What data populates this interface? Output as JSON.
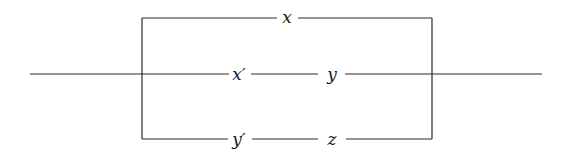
{
  "diagram": {
    "type": "switching-circuit",
    "stroke_color": "#2a2a2a",
    "text_color": "#1a1a1a",
    "background": "#ffffff",
    "branches": [
      {
        "name": "top",
        "switches": [
          "x"
        ]
      },
      {
        "name": "middle",
        "switches": [
          "x′",
          "y"
        ]
      },
      {
        "name": "bottom",
        "switches": [
          "y′",
          "z"
        ]
      }
    ],
    "labels": {
      "top_x": "x",
      "mid_xprime": "x′",
      "mid_y": "y",
      "bot_yprime": "y′",
      "bot_z": "z"
    }
  }
}
